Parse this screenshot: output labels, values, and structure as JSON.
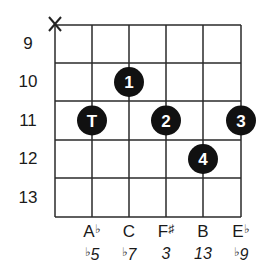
{
  "diagram": {
    "type": "chord-diagram",
    "muted_string_marker": "X",
    "muted_string_index": 0,
    "frets": [
      "9",
      "10",
      "11",
      "12",
      "13"
    ],
    "strings_count": 6,
    "dots": [
      {
        "string": 1,
        "fret": 11,
        "label": "T"
      },
      {
        "string": 2,
        "fret": 10,
        "label": "1"
      },
      {
        "string": 3,
        "fret": 11,
        "label": "2"
      },
      {
        "string": 4,
        "fret": 12,
        "label": "4"
      },
      {
        "string": 5,
        "fret": 11,
        "label": "3"
      }
    ],
    "notes": [
      {
        "name": "A",
        "accidental": "♭"
      },
      {
        "name": "C",
        "accidental": ""
      },
      {
        "name": "F",
        "accidental": "♯"
      },
      {
        "name": "B",
        "accidental": ""
      },
      {
        "name": "E",
        "accidental": "♭"
      }
    ],
    "degrees": [
      {
        "accidental": "♭",
        "value": "5"
      },
      {
        "accidental": "♭",
        "value": "7"
      },
      {
        "accidental": "",
        "value": "3"
      },
      {
        "accidental": "",
        "value": "13"
      },
      {
        "accidental": "♭",
        "value": "9"
      }
    ],
    "colors": {
      "line": "#2a2a2a",
      "dot": "#111111",
      "dot_text": "#ffffff"
    }
  }
}
